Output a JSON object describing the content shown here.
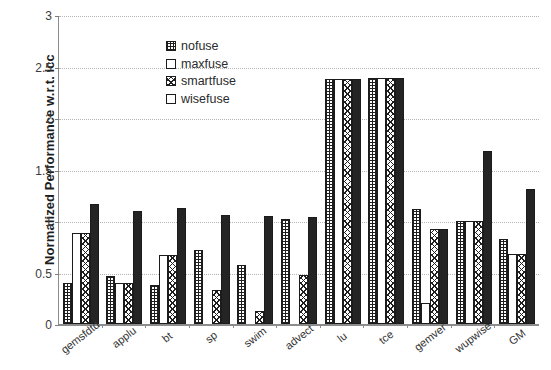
{
  "chart_data": {
    "type": "bar",
    "title": "",
    "xlabel": "",
    "ylabel": "Normalized Performance w.r.t. icc",
    "ylim": [
      0,
      3
    ],
    "yticks": [
      0,
      0.5,
      1,
      1.5,
      2,
      2.5,
      3
    ],
    "ytick_labels": [
      "0",
      "0.5",
      "1",
      "1.5",
      "2",
      "2.5",
      "3"
    ],
    "grid": true,
    "legend_position": "upper left inside",
    "categories": [
      "gemsfdtd",
      "applu",
      "bt",
      "sp",
      "swim",
      "advect",
      "lu",
      "tce",
      "gemver",
      "wupwise",
      "GM"
    ],
    "series": [
      {
        "name": "nofuse",
        "pattern": "grid-crosshatch",
        "values": [
          0.4,
          0.47,
          0.38,
          0.72,
          0.57,
          1.02,
          2.38,
          2.39,
          1.12,
          1.0,
          0.83
        ]
      },
      {
        "name": "maxfuse",
        "pattern": "empty-white",
        "values": [
          0.88,
          0.4,
          0.67,
          0.0,
          0.0,
          0.0,
          2.38,
          2.39,
          0.2,
          1.0,
          0.68
        ]
      },
      {
        "name": "smartfuse",
        "pattern": "diagonal-crosshatch",
        "values": [
          0.88,
          0.4,
          0.67,
          0.33,
          0.13,
          0.48,
          2.38,
          2.39,
          0.92,
          1.0,
          0.68
        ]
      },
      {
        "name": "wisefuse",
        "pattern": "solid-black",
        "values": [
          1.17,
          1.1,
          1.13,
          1.06,
          1.05,
          1.04,
          2.38,
          2.39,
          0.92,
          1.68,
          1.31
        ]
      }
    ]
  },
  "colors": {
    "axis": "#8c8c8c",
    "gridline": "#b4b4b4",
    "bar_outline": "#1b1b1b",
    "solid_fill": "#242424",
    "text": "#2b2b2b",
    "background": "#ffffff"
  }
}
